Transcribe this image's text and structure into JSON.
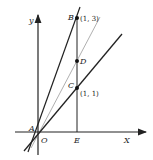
{
  "figure": {
    "axes": {
      "x_label": "X",
      "y_label": "y"
    },
    "points": [
      {
        "name": "A",
        "label": "A",
        "coord_label": ""
      },
      {
        "name": "O",
        "label": "O",
        "coord_label": ""
      },
      {
        "name": "B",
        "label": "B",
        "coord_label": "(1, 3)"
      },
      {
        "name": "D",
        "label": "D",
        "coord_label": ""
      },
      {
        "name": "C",
        "label": "C",
        "coord_label": "(1, 1)"
      },
      {
        "name": "E",
        "label": "E",
        "coord_label": ""
      }
    ],
    "lines": [
      {
        "name": "line-AB",
        "through": [
          "A",
          "B"
        ],
        "slope": 3
      },
      {
        "name": "line-AD",
        "through": [
          "A",
          "D"
        ],
        "slope": 2
      },
      {
        "name": "line-AC",
        "through": [
          "A",
          "C"
        ],
        "slope": 1
      },
      {
        "name": "segment-BE",
        "through": [
          "B",
          "E"
        ],
        "equation": "x = 1"
      }
    ],
    "colors": {
      "ink": "#222222",
      "light_line": "#9a9a9a"
    }
  }
}
